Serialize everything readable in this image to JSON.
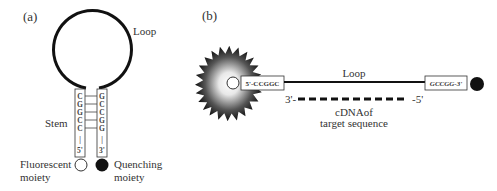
{
  "panel_a": {
    "label": "(a)",
    "loop_label": "Loop",
    "stem_label": "Stem",
    "left_strand": {
      "bases": [
        "C",
        "G",
        "G",
        "C",
        "C"
      ],
      "bar": "|",
      "end": "5'"
    },
    "right_strand": {
      "bases": [
        "G",
        "C",
        "C",
        "G",
        "G"
      ],
      "bar": "|",
      "end": "3'"
    },
    "fluorescent_label_line1": "Fluorescent",
    "fluorescent_label_line2": "moiety",
    "quenching_label_line1": "Quenching",
    "quenching_label_line2": "moiety"
  },
  "panel_b": {
    "label": "(b)",
    "loop_label": "Loop",
    "left_box": "5'-CCGGC",
    "right_box": "GCCGG-3'",
    "cdna_left_end": "3'-",
    "cdna_right_end": "-5'",
    "cdna_label_line1": "cDNAof",
    "cdna_label_line2": "target sequence"
  },
  "colors": {
    "stroke": "#111111",
    "quencher": "#111111",
    "fluor_glow_center": "#ffffff",
    "fluor_glow_edge": "#1a1a1a"
  }
}
